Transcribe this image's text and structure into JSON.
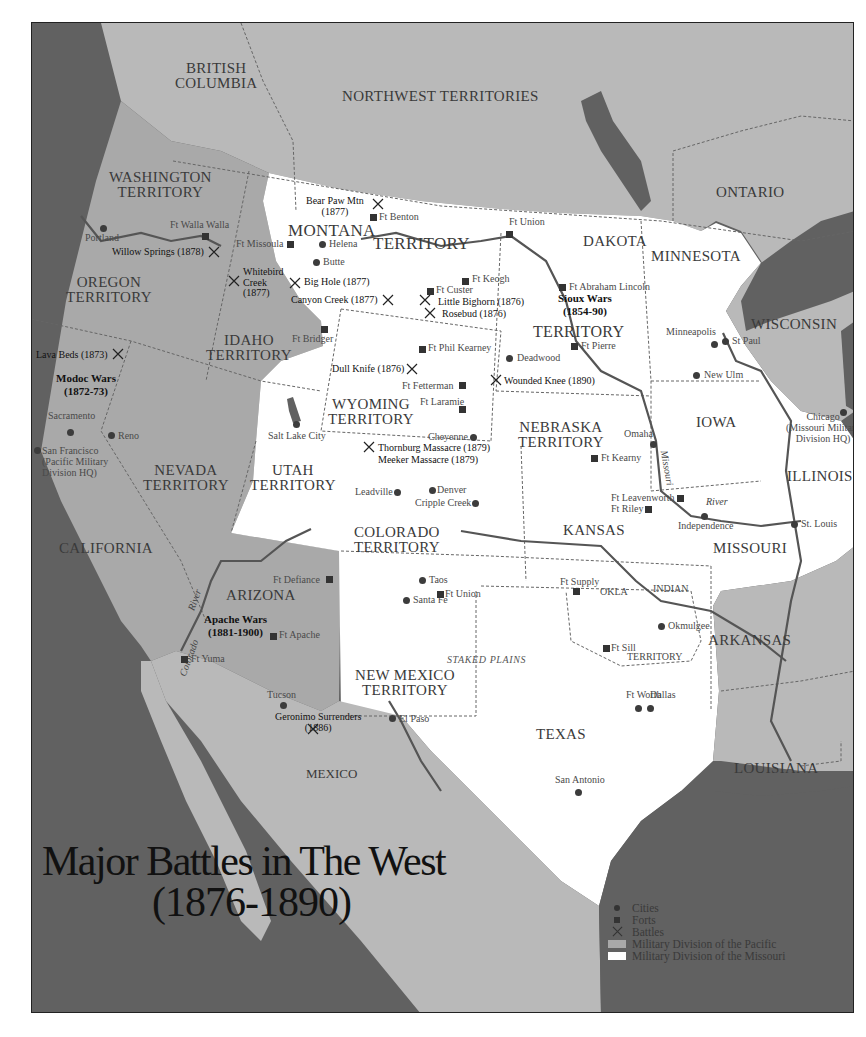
{
  "map": {
    "title": "Major Battles in The West",
    "subtitle": "(1876-1890)",
    "colors": {
      "ocean": "#616161",
      "foreign_land": "#b9b9b9",
      "pacific_division": "#a9a9a9",
      "missouri_division": "#ffffff",
      "border": "#222222",
      "river": "#555555"
    },
    "regions": {
      "british_columbia": "BRITISH\nCOLUMBIA",
      "northwest_territories": "NORTHWEST TERRITORIES",
      "ontario": "ONTARIO",
      "washington": "WASHINGTON\nTERRITORY",
      "oregon": "OREGON\nTERRITORY",
      "idaho": "IDAHO\nTERRITORY",
      "montana": "MONTANA",
      "montana_territory": "TERRITORY",
      "dakota": "DAKOTA",
      "dakota_territory": "TERRITORY",
      "minnesota": "MINNESOTA",
      "wisconsin": "WISCONSIN",
      "iowa": "IOWA",
      "illinois": "ILLINOIS",
      "wyoming": "WYOMING\nTERRITORY",
      "nebraska": "NEBRASKA\nTERRITORY",
      "nevada": "NEVADA\nTERRITORY",
      "utah": "UTAH\nTERRITORY",
      "california": "CALIFORNIA",
      "colorado": "COLORADO\nTERRITORY",
      "kansas": "KANSAS",
      "missouri": "MISSOURI",
      "arizona": "ARIZONA",
      "new_mexico": "NEW MEXICO\nTERRITORY",
      "okla": "OKLA",
      "indian": "INDIAN",
      "indian_territory": "TERRITORY",
      "arkansas": "ARKANSAS",
      "texas": "TEXAS",
      "louisiana": "LOUISIANA",
      "mexico": "MEXICO",
      "staked_plains": "STAKED PLAINS"
    },
    "cities": [
      {
        "name": "Portland"
      },
      {
        "name": "Helena"
      },
      {
        "name": "Butte"
      },
      {
        "name": "Sacramento"
      },
      {
        "name": "Reno"
      },
      {
        "name": "San Francisco\n(Pacific Military\nDivision HQ)"
      },
      {
        "name": "Salt Lake City"
      },
      {
        "name": "Deadwood"
      },
      {
        "name": "Cheyenne"
      },
      {
        "name": "Leadville"
      },
      {
        "name": "Denver"
      },
      {
        "name": "Cripple Creek"
      },
      {
        "name": "Minneapolis"
      },
      {
        "name": "St Paul"
      },
      {
        "name": "New Ulm"
      },
      {
        "name": "Omaha"
      },
      {
        "name": "Chicago\n(Missouri Military\nDivision HQ)"
      },
      {
        "name": "Independence"
      },
      {
        "name": "St. Louis"
      },
      {
        "name": "Taos"
      },
      {
        "name": "Santa Fe"
      },
      {
        "name": "Tucson"
      },
      {
        "name": "El Paso"
      },
      {
        "name": "Okmulgee"
      },
      {
        "name": "Ft Worth"
      },
      {
        "name": "Dallas"
      },
      {
        "name": "San Antonio"
      }
    ],
    "forts": [
      {
        "name": "Ft Walla Walla"
      },
      {
        "name": "Ft Missoula"
      },
      {
        "name": "Ft Benton"
      },
      {
        "name": "Ft Union"
      },
      {
        "name": "Ft Keogh"
      },
      {
        "name": "Ft Custer"
      },
      {
        "name": "Ft Abraham Lincoln"
      },
      {
        "name": "Ft Bridger"
      },
      {
        "name": "Ft Phil Kearney"
      },
      {
        "name": "Ft Pierre"
      },
      {
        "name": "Ft Fetterman"
      },
      {
        "name": "Ft Laramie"
      },
      {
        "name": "Ft Kearny"
      },
      {
        "name": "Ft Leavenworth"
      },
      {
        "name": "Ft Riley"
      },
      {
        "name": "Ft Defiance"
      },
      {
        "name": "Ft Union"
      },
      {
        "name": "Ft Supply"
      },
      {
        "name": "Ft Apache"
      },
      {
        "name": "Ft Sill"
      },
      {
        "name": "Ft Yuma"
      }
    ],
    "battles": [
      {
        "name": "Bear Paw Mtn\n(1877)"
      },
      {
        "name": "Willow Springs (1878)"
      },
      {
        "name": "Whitebird\nCreek\n(1877)"
      },
      {
        "name": "Big Hole (1877)"
      },
      {
        "name": "Canyon Creek (1877)"
      },
      {
        "name": "Little Bighorn (1876)"
      },
      {
        "name": "Rosebud (1876)"
      },
      {
        "name": "Lava Beds (1873)"
      },
      {
        "name": "Dull Knife (1876)"
      },
      {
        "name": "Wounded Knee (1890)"
      },
      {
        "name": "Thornburg Massacre (1879)"
      },
      {
        "name": "Meeker Massacre (1879)"
      },
      {
        "name": "Geronimo Surrenders\n(1886)"
      }
    ],
    "wars": [
      {
        "name": "Sioux Wars\n(1854-90)"
      },
      {
        "name": "Modoc Wars\n(1872-73)"
      },
      {
        "name": "Apache Wars\n(1881-1900)"
      }
    ],
    "rivers": {
      "missouri": "Missouri",
      "river_label_1": "River",
      "colorado": "Colorado",
      "river_label_2": "River"
    },
    "legend": {
      "cities": "Cities",
      "forts": "Forts",
      "battles": "Battles",
      "pacific": "Military Division of the Pacific",
      "missouri": "Military Division of the Missouri"
    }
  }
}
